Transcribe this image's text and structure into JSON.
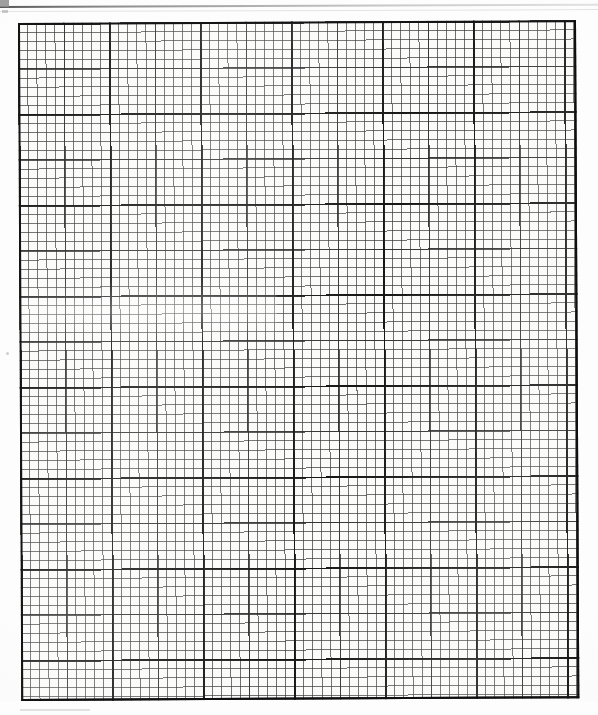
{
  "document": {
    "type": "scanned-graph-paper",
    "title": "Blank graph paper sheet",
    "description": "A scanned blank sheet of engineering graph paper with a fine square grid, no plotted data, no labels and no text.",
    "page_width_px": 598,
    "page_height_px": 715,
    "paper_color": "#fdfdfd",
    "ink_color": "#141414"
  },
  "grid": {
    "name": "graph-paper-grid",
    "left_px": 18,
    "top_px": 23,
    "width_px": 558,
    "height_px": 678,
    "cell_size_px": 9.1,
    "columns": 61,
    "rows": 74,
    "minor_every": 1,
    "medium_every": 5,
    "major_every": 10,
    "minor_line_color": "#373737",
    "medium_line_color": "#282828",
    "major_line_color": "#121212",
    "border_color": "#141414",
    "border_width_px": 2,
    "skew_degrees": -0.28
  },
  "artifacts": {
    "top_scan_edge": {
      "name": "scanner-edge-line",
      "y_px": 6,
      "color": "#5a5a5a"
    },
    "top_left_mark": {
      "name": "scan-corner-mark",
      "x_px": 0,
      "y_px": 0,
      "color": "#8f8f8f"
    },
    "bottom_margin_height_px": 14
  },
  "chart_data": {
    "type": "table",
    "title": "",
    "subtitle": "",
    "xlabel": "",
    "ylabel": "",
    "categories": [],
    "values": [],
    "series": [],
    "legend": [],
    "annotations": [],
    "grid": true,
    "legend_position": "none",
    "note": "Blank graph paper — no data series, axes ticks, or labels are printed on the sheet."
  }
}
